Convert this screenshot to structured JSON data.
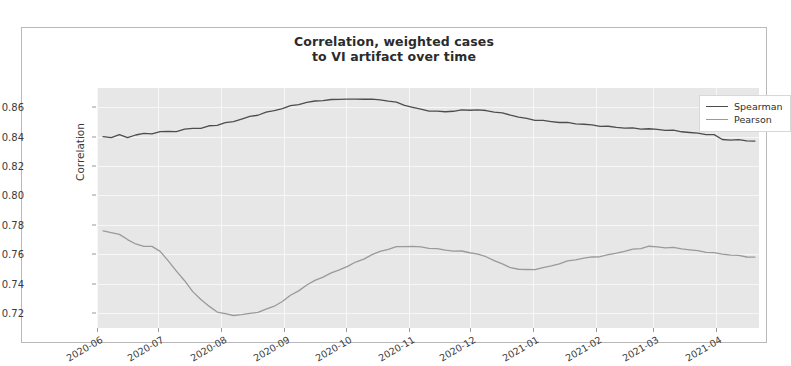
{
  "chart_data": {
    "type": "line",
    "title": "Correlation, weighted cases\nto VI artifact over time",
    "title_line1": "Correlation, weighted cases",
    "title_line2": "to VI artifact over time",
    "xlabel": "",
    "ylabel": "Correlation",
    "ylim": [
      0.71,
      0.873
    ],
    "xlim": [
      "2020-06-01",
      "2021-04-22"
    ],
    "grid": true,
    "legend_position": "upper right",
    "yticks": [
      0.72,
      0.74,
      0.76,
      0.78,
      0.8,
      0.82,
      0.84,
      0.86
    ],
    "ytick_labels": [
      "0.72",
      "0.74",
      "0.76",
      "0.78",
      "0.80",
      "0.82",
      "0.84",
      "0.86"
    ],
    "xticks": [
      "2020-06",
      "2020-07",
      "2020-08",
      "2020-09",
      "2020-10",
      "2020-11",
      "2020-12",
      "2021-01",
      "2021-02",
      "2021-03",
      "2021-04"
    ],
    "xtick_labels": [
      "2020-06",
      "2020-07",
      "2020-08",
      "2020-09",
      "2020-10",
      "2020-11",
      "2020-12",
      "2021-01",
      "2021-02",
      "2021-03",
      "2021-04"
    ],
    "colors": {
      "spearman": "#4d4d4d",
      "pearson": "#9a9a9a",
      "axes_background": "#e7e7e7",
      "gridline": "#f7f7f7",
      "frame_border": "#b9b9b9"
    },
    "series": [
      {
        "name": "Spearman",
        "color": "#4d4d4d",
        "x": [
          "2020-06-04",
          "2020-06-08",
          "2020-06-12",
          "2020-06-16",
          "2020-06-20",
          "2020-06-24",
          "2020-06-28",
          "2020-07-02",
          "2020-07-06",
          "2020-07-10",
          "2020-07-14",
          "2020-07-18",
          "2020-07-22",
          "2020-07-26",
          "2020-07-30",
          "2020-08-03",
          "2020-08-07",
          "2020-08-11",
          "2020-08-15",
          "2020-08-19",
          "2020-08-23",
          "2020-08-27",
          "2020-08-31",
          "2020-09-04",
          "2020-09-08",
          "2020-09-12",
          "2020-09-16",
          "2020-09-20",
          "2020-09-24",
          "2020-09-28",
          "2020-10-02",
          "2020-10-06",
          "2020-10-10",
          "2020-10-14",
          "2020-10-18",
          "2020-10-22",
          "2020-10-26",
          "2020-10-30",
          "2020-11-03",
          "2020-11-07",
          "2020-11-11",
          "2020-11-15",
          "2020-11-19",
          "2020-11-23",
          "2020-11-27",
          "2020-12-01",
          "2020-12-05",
          "2020-12-09",
          "2020-12-13",
          "2020-12-17",
          "2020-12-21",
          "2020-12-25",
          "2020-12-29",
          "2021-01-02",
          "2021-01-06",
          "2021-01-10",
          "2021-01-14",
          "2021-01-18",
          "2021-01-22",
          "2021-01-26",
          "2021-01-30",
          "2021-02-03",
          "2021-02-07",
          "2021-02-11",
          "2021-02-15",
          "2021-02-19",
          "2021-02-23",
          "2021-02-27",
          "2021-03-03",
          "2021-03-07",
          "2021-03-11",
          "2021-03-15",
          "2021-03-19",
          "2021-03-23",
          "2021-03-27",
          "2021-03-31",
          "2021-04-04",
          "2021-04-08",
          "2021-04-12",
          "2021-04-16",
          "2021-04-20"
        ],
        "values": [
          0.84,
          0.8394,
          0.8407,
          0.8392,
          0.8408,
          0.8419,
          0.8422,
          0.8433,
          0.844,
          0.8437,
          0.8449,
          0.8458,
          0.8452,
          0.847,
          0.8476,
          0.8489,
          0.8503,
          0.852,
          0.8537,
          0.8551,
          0.8566,
          0.8578,
          0.8592,
          0.8605,
          0.8617,
          0.8628,
          0.8638,
          0.8646,
          0.865,
          0.8656,
          0.8659,
          0.8655,
          0.8658,
          0.8652,
          0.8647,
          0.864,
          0.8628,
          0.8612,
          0.8598,
          0.8586,
          0.8578,
          0.8574,
          0.8572,
          0.8575,
          0.8578,
          0.858,
          0.8578,
          0.8573,
          0.8567,
          0.8558,
          0.8548,
          0.8535,
          0.8524,
          0.8516,
          0.8509,
          0.8502,
          0.8496,
          0.8491,
          0.8486,
          0.8481,
          0.8477,
          0.8474,
          0.847,
          0.8466,
          0.8462,
          0.8458,
          0.8454,
          0.845,
          0.8446,
          0.8442,
          0.8438,
          0.8434,
          0.8429,
          0.8424,
          0.842,
          0.8414,
          0.8382,
          0.8378,
          0.8374,
          0.837,
          0.8366
        ]
      },
      {
        "name": "Pearson",
        "color": "#9a9a9a",
        "x": [
          "2020-06-04",
          "2020-06-08",
          "2020-06-12",
          "2020-06-16",
          "2020-06-20",
          "2020-06-24",
          "2020-06-28",
          "2020-07-02",
          "2020-07-06",
          "2020-07-10",
          "2020-07-14",
          "2020-07-18",
          "2020-07-22",
          "2020-07-26",
          "2020-07-30",
          "2020-08-03",
          "2020-08-07",
          "2020-08-11",
          "2020-08-15",
          "2020-08-19",
          "2020-08-23",
          "2020-08-27",
          "2020-08-31",
          "2020-09-04",
          "2020-09-08",
          "2020-09-12",
          "2020-09-16",
          "2020-09-20",
          "2020-09-24",
          "2020-09-28",
          "2020-10-02",
          "2020-10-06",
          "2020-10-10",
          "2020-10-14",
          "2020-10-18",
          "2020-10-22",
          "2020-10-26",
          "2020-10-30",
          "2020-11-03",
          "2020-11-07",
          "2020-11-11",
          "2020-11-15",
          "2020-11-19",
          "2020-11-23",
          "2020-11-27",
          "2020-12-01",
          "2020-12-05",
          "2020-12-09",
          "2020-12-13",
          "2020-12-17",
          "2020-12-21",
          "2020-12-25",
          "2020-12-29",
          "2021-01-02",
          "2021-01-06",
          "2021-01-10",
          "2021-01-14",
          "2021-01-18",
          "2021-01-22",
          "2021-01-26",
          "2021-01-30",
          "2021-02-03",
          "2021-02-07",
          "2021-02-11",
          "2021-02-15",
          "2021-02-19",
          "2021-02-23",
          "2021-02-27",
          "2021-03-03",
          "2021-03-07",
          "2021-03-11",
          "2021-03-15",
          "2021-03-19",
          "2021-03-23",
          "2021-03-27",
          "2021-03-31",
          "2021-04-04",
          "2021-04-08",
          "2021-04-12",
          "2021-04-16",
          "2021-04-20"
        ],
        "values": [
          0.776,
          0.7748,
          0.773,
          0.77,
          0.7668,
          0.7652,
          0.7658,
          0.762,
          0.756,
          0.749,
          0.742,
          0.735,
          0.729,
          0.7245,
          0.7208,
          0.7192,
          0.7186,
          0.7192,
          0.72,
          0.7212,
          0.7228,
          0.725,
          0.7282,
          0.7318,
          0.7352,
          0.7388,
          0.742,
          0.7448,
          0.7472,
          0.7498,
          0.7522,
          0.7548,
          0.7572,
          0.7596,
          0.7618,
          0.7634,
          0.7646,
          0.7652,
          0.7654,
          0.765,
          0.7646,
          0.764,
          0.7632,
          0.7625,
          0.762,
          0.7612,
          0.7598,
          0.758,
          0.7558,
          0.7532,
          0.7512,
          0.7502,
          0.7498,
          0.7502,
          0.751,
          0.7522,
          0.7536,
          0.755,
          0.7562,
          0.7572,
          0.758,
          0.7588,
          0.7598,
          0.7612,
          0.7624,
          0.7634,
          0.7642,
          0.7652,
          0.7648,
          0.7644,
          0.7642,
          0.7638,
          0.7632,
          0.7626,
          0.762,
          0.7612,
          0.7604,
          0.7596,
          0.7588,
          0.7582,
          0.7578
        ]
      }
    ],
    "annotations": []
  },
  "legend": {
    "entries": [
      {
        "label": "Spearman",
        "color": "#4d4d4d"
      },
      {
        "label": "Pearson",
        "color": "#9a9a9a"
      }
    ]
  }
}
